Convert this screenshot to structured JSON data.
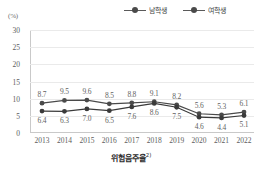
{
  "unit_label": "(%)",
  "caption": {
    "text": "위험음주율",
    "footnote_marker": "2)"
  },
  "legend": {
    "position": "top-right",
    "entries": [
      {
        "label": "남학생",
        "color": "#4a4a4a"
      },
      {
        "label": "여학생",
        "color": "#3a3a3a"
      }
    ]
  },
  "axis": {
    "y_ticks": [
      "30",
      "25",
      "20",
      "15",
      "10",
      "5",
      "0"
    ],
    "x_ticks": [
      "2013",
      "2014",
      "2015",
      "2016",
      "2017",
      "2018",
      "2019",
      "2020",
      "2021",
      "2022"
    ]
  },
  "chart_data": {
    "type": "line",
    "title": "위험음주율",
    "xlabel": "",
    "ylabel": "(%)",
    "ylim": [
      0,
      30
    ],
    "y_step": 5,
    "grid": true,
    "legend_position": "top-right",
    "categories": [
      "2013",
      "2014",
      "2015",
      "2016",
      "2017",
      "2018",
      "2019",
      "2020",
      "2021",
      "2022"
    ],
    "series": [
      {
        "name": "남학생",
        "color": "#4a4a4a",
        "label_position": "above",
        "values": [
          8.7,
          9.5,
          9.6,
          8.5,
          8.8,
          9.1,
          8.2,
          5.6,
          5.3,
          6.1
        ],
        "labels": [
          "8.7",
          "9.5",
          "9.6",
          "8.5",
          "8.8",
          "9.1",
          "8.2",
          "5.6",
          "5.3",
          "6.1"
        ]
      },
      {
        "name": "여학생",
        "color": "#3a3a3a",
        "label_position": "below",
        "values": [
          6.4,
          6.3,
          7.0,
          6.5,
          7.6,
          8.6,
          7.5,
          4.6,
          4.4,
          5.1
        ],
        "labels": [
          "6.4",
          "6.3",
          "7.0",
          "6.5",
          "7.6",
          "8.6",
          "7.5",
          "4.6",
          "4.4",
          "5.1"
        ]
      }
    ]
  }
}
